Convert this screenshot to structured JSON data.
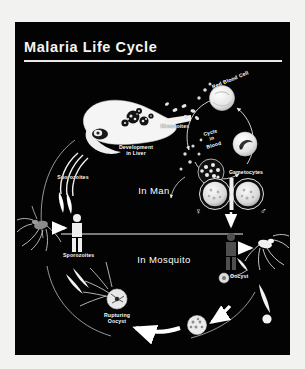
{
  "poster": {
    "title": "Malaria Life Cycle",
    "background_color": "#030303",
    "text_color": "#ffffff",
    "frame_color": "#f2f2f0"
  },
  "labels": {
    "development_in_liver": "Development\nin Liver",
    "merozoites": "Merozoites",
    "red_blood_cell": "Red Blood Cell",
    "cycle_in_blood": "Cycle\nin\nBlood",
    "gametocytes": "Gametocytes",
    "sporozoites_man": "Sporozoites",
    "in_man": "In Man",
    "in_mosquito": "In Mosquito",
    "sporozoites_mosquito": "Sporozoites",
    "oocyst": "Oocyst",
    "rupturing_oocyst": "Rupturing\nOocyst"
  },
  "symbols": {
    "female": "♀",
    "male": "♂"
  },
  "diagram": {
    "type": "cycle-diagram",
    "host_sections": [
      "In Man",
      "In Mosquito"
    ],
    "stages": [
      "Sporozoites",
      "Development in Liver",
      "Merozoites",
      "Cycle in Blood",
      "Red Blood Cell",
      "Gametocytes",
      "Oocyst",
      "Rupturing Oocyst"
    ]
  }
}
